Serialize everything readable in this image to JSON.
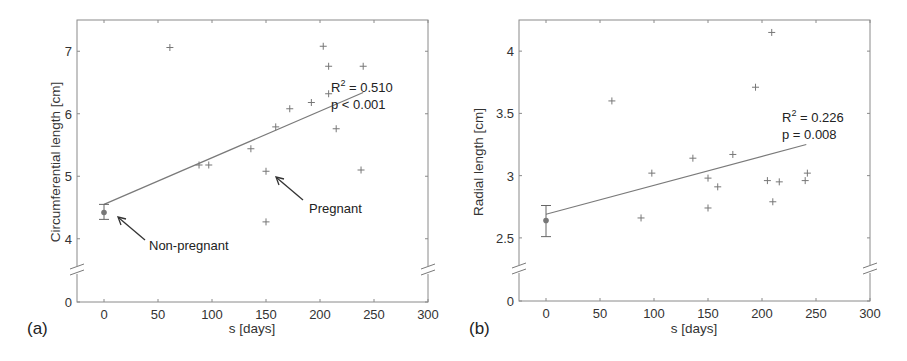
{
  "figure": {
    "background": "#ffffff",
    "line_color": "#7a7a7a",
    "marker_color": "#777777"
  },
  "chart_data": [
    {
      "panel": "(a)",
      "type": "scatter",
      "title": "",
      "xlabel": "s [days]",
      "ylabel": "Circumferential length [cm]",
      "xlim": [
        -25,
        300
      ],
      "ylim_upper": [
        3.5,
        7.5
      ],
      "ylim_broken_lower": 0,
      "xticks": [
        0,
        50,
        100,
        150,
        200,
        250,
        300
      ],
      "yticks": [
        0,
        4,
        5,
        6,
        7
      ],
      "grid": false,
      "axis_break": true,
      "non_pregnant": {
        "x": 0,
        "mean": 4.42,
        "err_low": 4.31,
        "err_high": 4.55
      },
      "pregnant_points": [
        [
          61,
          7.06
        ],
        [
          88,
          5.18
        ],
        [
          97,
          5.18
        ],
        [
          136,
          5.44
        ],
        [
          150,
          5.08
        ],
        [
          150,
          4.27
        ],
        [
          159,
          5.79
        ],
        [
          172,
          6.08
        ],
        [
          192,
          6.18
        ],
        [
          203,
          7.08
        ],
        [
          208,
          6.76
        ],
        [
          208,
          6.32
        ],
        [
          215,
          5.76
        ],
        [
          238,
          5.1
        ],
        [
          240,
          6.76
        ]
      ],
      "fit_line": {
        "x": [
          0,
          240
        ],
        "y": [
          4.55,
          6.34
        ]
      },
      "stats": {
        "r2": "R² = 0.510",
        "r2_base": "R",
        "r2_sup": "2",
        "r2_val": " = 0.510",
        "p": "p < 0.001"
      },
      "annotations": [
        {
          "text": "Non-pregnant",
          "label": "non-pregnant"
        },
        {
          "text": "Pregnant",
          "label": "pregnant"
        }
      ]
    },
    {
      "panel": "(b)",
      "type": "scatter",
      "title": "",
      "xlabel": "s [days]",
      "ylabel": "Radial length [cm]",
      "xlim": [
        -25,
        300
      ],
      "ylim_upper": [
        2.25,
        4.25
      ],
      "ylim_broken_lower": 0,
      "xticks": [
        0,
        50,
        100,
        150,
        200,
        250,
        300
      ],
      "yticks": [
        0,
        2.5,
        3,
        3.5,
        4
      ],
      "grid": false,
      "axis_break": true,
      "non_pregnant": {
        "x": 0,
        "mean": 2.64,
        "err_low": 2.51,
        "err_high": 2.76
      },
      "pregnant_points": [
        [
          61,
          3.6
        ],
        [
          88,
          2.66
        ],
        [
          98,
          3.02
        ],
        [
          136,
          3.14
        ],
        [
          150,
          2.98
        ],
        [
          150,
          2.74
        ],
        [
          159,
          2.91
        ],
        [
          173,
          3.17
        ],
        [
          194,
          3.71
        ],
        [
          205,
          2.96
        ],
        [
          209,
          4.15
        ],
        [
          210,
          2.79
        ],
        [
          216,
          2.95
        ],
        [
          240,
          2.96
        ],
        [
          242,
          3.02
        ]
      ],
      "fit_line": {
        "x": [
          0,
          241
        ],
        "y": [
          2.69,
          3.25
        ]
      },
      "stats": {
        "r2_base": "R",
        "r2_sup": "2",
        "r2_val": " = 0.226",
        "p": "p = 0.008"
      },
      "annotations": []
    }
  ],
  "panels": {
    "a": {
      "label": "(a)",
      "xlabel": "s [days]",
      "ylabel": "Circumferential length [cm]",
      "r2_base": "R",
      "r2_sup": "2",
      "r2_val": " = 0.510",
      "p_text": "p < 0.001",
      "annot_nonpregnant": "Non-pregnant",
      "annot_pregnant": "Pregnant"
    },
    "b": {
      "label": "(b)",
      "xlabel": "s [days]",
      "ylabel": "Radial length [cm]",
      "r2_base": "R",
      "r2_sup": "2",
      "r2_val": " = 0.226",
      "p_text": "p = 0.008"
    }
  }
}
